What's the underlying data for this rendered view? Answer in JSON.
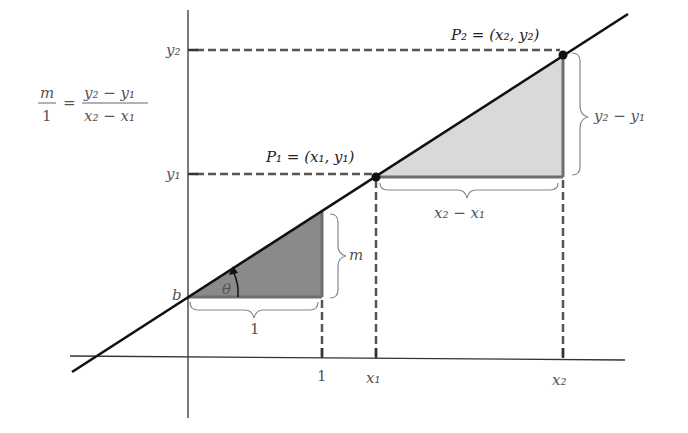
{
  "diagram": {
    "colors": {
      "line": "#111111",
      "axis": "#333333",
      "dash": "#555555",
      "small_triangle_fill": "#8a8a8a",
      "large_triangle_fill": "#d9d9d9",
      "triangle_edge": "#6e6e6e",
      "brace": "#888888",
      "label": "#555555",
      "point_label": "#222222"
    },
    "formula": {
      "lhs_num": "m",
      "lhs_den": "1",
      "equals": "=",
      "rhs_num": "y₂ − y₁",
      "rhs_den": "x₂ − x₁"
    },
    "points": {
      "p1_label": "P₁ = (x₁, y₁)",
      "p2_label": "P₂ = (x₂, y₂)"
    },
    "axis_labels": {
      "y_axis": [
        "y₂",
        "y₁"
      ],
      "x_axis": [
        "1",
        "x₁",
        "x₂"
      ],
      "intercept": "b"
    },
    "small_triangle": {
      "angle": "θ",
      "run": "1",
      "rise": "m"
    },
    "large_triangle": {
      "run": "x₂ − x₁",
      "rise": "y₂ − y₁"
    }
  }
}
